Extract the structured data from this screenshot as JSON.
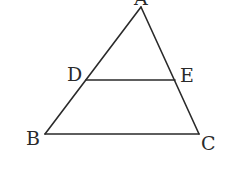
{
  "diagram": {
    "type": "geometry-triangle",
    "stroke_color": "#2a2a2a",
    "background": "#ffffff",
    "points": {
      "A": {
        "label": "A",
        "x": 141,
        "y": 7
      },
      "B": {
        "label": "B",
        "x": 45,
        "y": 134
      },
      "C": {
        "label": "C",
        "x": 199,
        "y": 134
      },
      "D": {
        "label": "D",
        "x": 86,
        "y": 80
      },
      "E": {
        "label": "E",
        "x": 175,
        "y": 80
      }
    },
    "segments": [
      {
        "name": "AB",
        "from": "A",
        "to": "B"
      },
      {
        "name": "AC",
        "from": "A",
        "to": "C"
      },
      {
        "name": "BC",
        "from": "B",
        "to": "C"
      },
      {
        "name": "DE",
        "from": "D",
        "to": "E"
      }
    ],
    "labels": {
      "A": "A",
      "B": "B",
      "C": "C",
      "D": "D",
      "E": "E"
    }
  }
}
